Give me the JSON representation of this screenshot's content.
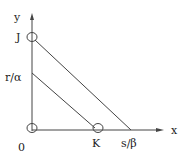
{
  "diagram": {
    "axes": {
      "x_label": "x",
      "y_label": "y",
      "origin_label": "0"
    },
    "y_ticks": [
      {
        "label": "J"
      },
      {
        "label": "r/α"
      }
    ],
    "x_ticks": [
      {
        "label": "K"
      },
      {
        "label": "s/β"
      }
    ],
    "lines": [
      {
        "from": "J",
        "to": "s/β"
      },
      {
        "from": "r/α",
        "to": "K"
      }
    ],
    "marked_points": [
      "origin",
      "J",
      "K"
    ],
    "colors": {
      "stroke": "#333333",
      "background": "#ffffff"
    }
  }
}
